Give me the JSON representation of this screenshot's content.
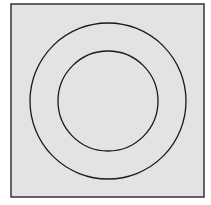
{
  "diagram": {
    "background": "#ffffff",
    "panel": {
      "x": 11,
      "y": 4,
      "width": 193,
      "height": 193,
      "fill": "#e3e3e3",
      "stroke": "#333333"
    },
    "center": {
      "x": 108,
      "y": 101
    },
    "circles": [
      {
        "name": "outer-circle",
        "r": 78,
        "stroke": "#1a1a1a"
      },
      {
        "name": "inner-circle",
        "r": 50,
        "stroke": "#1a1a1a"
      }
    ]
  }
}
